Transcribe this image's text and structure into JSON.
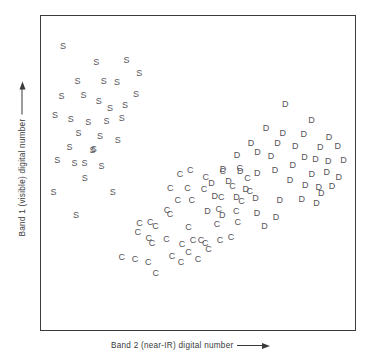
{
  "chart_data": {
    "type": "scatter",
    "title": "",
    "xlabel": "Band 2 (near-IR) digital number",
    "ylabel": "Band 1 (visible) digital number",
    "xlabel_arrow": "right-arrow",
    "ylabel_arrow": "up-arrow",
    "axis_ticks": false,
    "grid": false,
    "axis_numeric_labels": false,
    "xlim": [
      0,
      100
    ],
    "ylim": [
      0,
      100
    ],
    "point_color": "#57545a",
    "frame_color": "#3b3b3b",
    "legend": "none",
    "note": "Three labelled clusters plotted as letter glyphs; axes are unnumbered schematic feature-space axes.",
    "series": [
      {
        "name": "Sand",
        "marker": "S",
        "count": 32,
        "points": [
          [
            4.7,
            92.5
          ],
          [
            15.9,
            87.4
          ],
          [
            26.0,
            88.0
          ],
          [
            30.3,
            83.6
          ],
          [
            9.6,
            80.8
          ],
          [
            18.4,
            80.8
          ],
          [
            22.8,
            80.5
          ],
          [
            4.2,
            75.9
          ],
          [
            11.6,
            76.3
          ],
          [
            16.7,
            74.0
          ],
          [
            20.5,
            71.8
          ],
          [
            2.0,
            69.5
          ],
          [
            7.3,
            68.0
          ],
          [
            13.2,
            67.2
          ],
          [
            19.3,
            67.3
          ],
          [
            24.4,
            68.4
          ],
          [
            9.9,
            63.5
          ],
          [
            17.1,
            62.4
          ],
          [
            23.1,
            61.0
          ],
          [
            6.9,
            58.7
          ],
          [
            14.6,
            57.8
          ],
          [
            2.8,
            54.2
          ],
          [
            8.6,
            53.3
          ],
          [
            11.9,
            53.2
          ],
          [
            17.6,
            52.3
          ],
          [
            12.0,
            48.2
          ],
          [
            1.5,
            43.5
          ],
          [
            21.4,
            43.5
          ],
          [
            9.1,
            36.0
          ],
          [
            25.5,
            72.8
          ],
          [
            29.2,
            76.5
          ],
          [
            15.0,
            58.0
          ]
        ]
      },
      {
        "name": "Crops",
        "marker": "C",
        "count": 44,
        "points": [
          [
            44.0,
            49.5
          ],
          [
            47.4,
            51.0
          ],
          [
            52.6,
            48.7
          ],
          [
            58.3,
            50.8
          ],
          [
            64.0,
            51.7
          ],
          [
            66.6,
            48.3
          ],
          [
            40.7,
            45.1
          ],
          [
            46.5,
            44.9
          ],
          [
            52.0,
            44.5
          ],
          [
            61.6,
            45.6
          ],
          [
            67.4,
            44.0
          ],
          [
            43.2,
            40.9
          ],
          [
            47.9,
            40.8
          ],
          [
            57.8,
            42.1
          ],
          [
            64.6,
            40.5
          ],
          [
            39.6,
            37.6
          ],
          [
            40.6,
            36.3
          ],
          [
            57.0,
            38.0
          ],
          [
            62.8,
            37.4
          ],
          [
            30.4,
            33.1
          ],
          [
            34.0,
            33.4
          ],
          [
            35.7,
            32.3
          ],
          [
            46.8,
            31.9
          ],
          [
            56.4,
            32.8
          ],
          [
            63.3,
            33.7
          ],
          [
            33.5,
            28.1
          ],
          [
            34.6,
            26.5
          ],
          [
            39.4,
            28.0
          ],
          [
            44.6,
            26.3
          ],
          [
            48.3,
            27.4
          ],
          [
            51.0,
            27.6
          ],
          [
            52.4,
            26.4
          ],
          [
            57.4,
            27.6
          ],
          [
            61.1,
            28.5
          ],
          [
            24.4,
            21.7
          ],
          [
            28.9,
            21.2
          ],
          [
            33.3,
            20.0
          ],
          [
            41.3,
            22.2
          ],
          [
            44.3,
            20.3
          ],
          [
            46.8,
            23.5
          ],
          [
            50.0,
            21.2
          ],
          [
            35.8,
            16.5
          ],
          [
            53.5,
            24.4
          ],
          [
            29.8,
            30.2
          ]
        ]
      },
      {
        "name": "Deciduous forest",
        "marker": "D",
        "count": 45,
        "points": [
          [
            79.3,
            73.0
          ],
          [
            88.1,
            67.8
          ],
          [
            72.8,
            65.1
          ],
          [
            78.4,
            63.5
          ],
          [
            85.5,
            63.0
          ],
          [
            94.0,
            62.0
          ],
          [
            67.8,
            60.0
          ],
          [
            76.7,
            59.9
          ],
          [
            82.6,
            59.2
          ],
          [
            91.0,
            58.6
          ],
          [
            96.9,
            59.0
          ],
          [
            63.1,
            56.0
          ],
          [
            70.0,
            57.0
          ],
          [
            74.5,
            55.7
          ],
          [
            85.7,
            55.5
          ],
          [
            89.4,
            54.6
          ],
          [
            93.7,
            53.9
          ],
          [
            98.8,
            54.4
          ],
          [
            58.4,
            51.3
          ],
          [
            64.2,
            50.7
          ],
          [
            69.9,
            50.0
          ],
          [
            75.8,
            51.0
          ],
          [
            88.2,
            49.7
          ],
          [
            93.2,
            50.5
          ],
          [
            97.2,
            48.8
          ],
          [
            54.5,
            46.8
          ],
          [
            60.2,
            47.4
          ],
          [
            86.0,
            46.0
          ],
          [
            90.5,
            45.3
          ],
          [
            95.0,
            45.7
          ],
          [
            91.4,
            43.4
          ],
          [
            55.6,
            42.3
          ],
          [
            62.9,
            41.9
          ],
          [
            69.3,
            41.6
          ],
          [
            77.4,
            41.0
          ],
          [
            84.8,
            41.3
          ],
          [
            89.8,
            40.0
          ],
          [
            53.2,
            37.3
          ],
          [
            58.1,
            35.9
          ],
          [
            69.8,
            36.5
          ],
          [
            76.2,
            35.1
          ],
          [
            72.3,
            32.2
          ],
          [
            80.9,
            47.8
          ],
          [
            66.0,
            44.6
          ],
          [
            81.8,
            52.6
          ]
        ]
      }
    ]
  }
}
